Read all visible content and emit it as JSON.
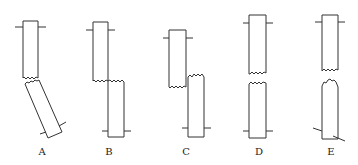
{
  "figures": [
    {
      "id": "A",
      "label": "A",
      "description": "lower piece rotated / bent"
    },
    {
      "id": "B",
      "label": "B",
      "description": "lower piece offset laterally to the right"
    },
    {
      "id": "C",
      "label": "C",
      "description": "pieces offset laterally and overlapping vertically"
    },
    {
      "id": "D",
      "label": "D",
      "description": "pieces separated axially with gap"
    },
    {
      "id": "E",
      "label": "E",
      "description": "pieces separated with lower piece fractured and rotated markers"
    }
  ],
  "colors": {
    "stroke": "#333333",
    "background": "#ffffff"
  }
}
